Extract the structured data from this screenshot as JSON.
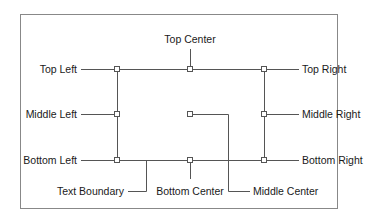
{
  "diagram": {
    "labels": {
      "top_center": "Top Center",
      "top_left": "Top Left",
      "top_right": "Top Right",
      "middle_left": "Middle Left",
      "middle_right": "Middle Right",
      "bottom_left": "Bottom Left",
      "bottom_right": "Bottom Right",
      "text_boundary": "Text Boundary",
      "bottom_center": "Bottom Center",
      "middle_center": "Middle Center"
    },
    "colors": {
      "line": "#555555",
      "frame": "#888888",
      "text": "#1a1a1a"
    }
  }
}
